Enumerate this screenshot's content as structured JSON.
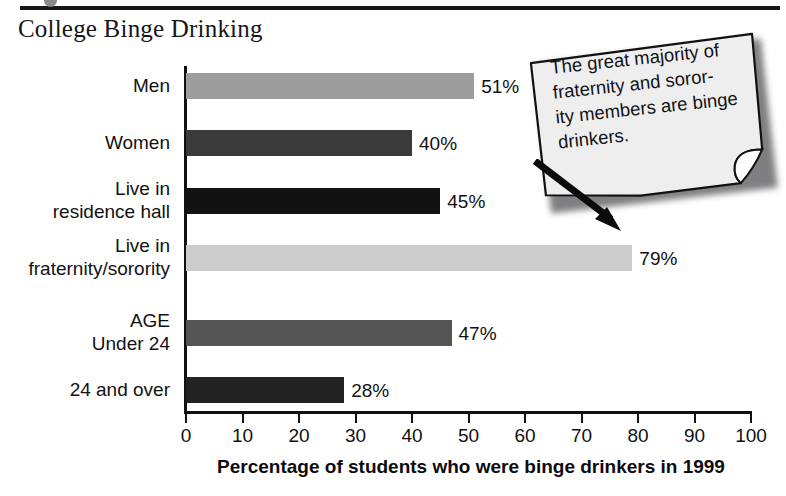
{
  "header": {
    "rule_present": true,
    "title": "College Binge Drinking"
  },
  "chart_data": {
    "type": "bar",
    "orientation": "horizontal",
    "title": "College Binge Drinking",
    "xlabel": "Percentage of students who were binge drinkers in 1999",
    "ylabel": "",
    "xlim": [
      0,
      100
    ],
    "xticks": [
      0,
      10,
      20,
      30,
      40,
      50,
      60,
      70,
      80,
      90,
      100
    ],
    "xtick_labels": [
      "0",
      "10",
      "20",
      "30",
      "40",
      "50",
      "60",
      "70",
      "80",
      "90",
      "100"
    ],
    "grid": false,
    "legend": "none",
    "categories": [
      "Men",
      "Women",
      "Live in\nresidence hall",
      "Live in\nfraternity/sorority",
      "AGE\nUnder 24",
      "24 and over"
    ],
    "values": [
      51,
      40,
      45,
      79,
      47,
      28
    ],
    "value_labels": [
      "51%",
      "40%",
      "45%",
      "79%",
      "47%",
      "28%"
    ],
    "bar_colors": [
      "#9d9d9d",
      "#3a3a3a",
      "#121212",
      "#cccccc",
      "#555555",
      "#222222"
    ]
  },
  "bars": [
    {
      "label_line1": "Men",
      "label_line2": "",
      "value": 51,
      "value_label": "51%",
      "color": "#9d9d9d"
    },
    {
      "label_line1": "Women",
      "label_line2": "",
      "value": 40,
      "value_label": "40%",
      "color": "#3a3a3a"
    },
    {
      "label_line1": "Live in",
      "label_line2": "residence hall",
      "value": 45,
      "value_label": "45%",
      "color": "#121212"
    },
    {
      "label_line1": "Live in",
      "label_line2": "fraternity/sorority",
      "value": 79,
      "value_label": "79%",
      "color": "#cccccc"
    },
    {
      "label_line1": "AGE",
      "label_line2": "Under 24",
      "value": 47,
      "value_label": "47%",
      "color": "#555555"
    },
    {
      "label_line1": "24 and over",
      "label_line2": "",
      "value": 28,
      "value_label": "28%",
      "color": "#222222"
    }
  ],
  "axis": {
    "title": "Percentage of students who were binge drinkers in 1999",
    "ticks": [
      "0",
      "10",
      "20",
      "30",
      "40",
      "50",
      "60",
      "70",
      "80",
      "90",
      "100"
    ]
  },
  "callout": {
    "text": "The great majority of fraternity and soror-\nity members are binge drinkers.",
    "points_to": "Live in fraternity/sorority",
    "fill_color": "#eeeeee",
    "border_color": "#111111"
  }
}
